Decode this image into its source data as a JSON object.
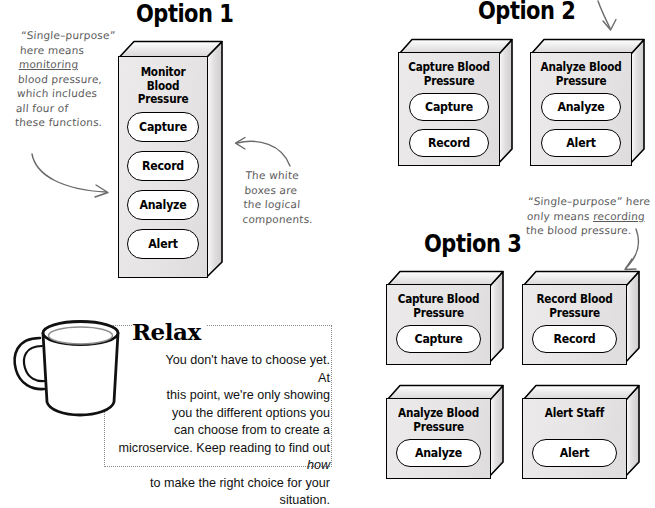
{
  "page": {
    "background": "#ffffff",
    "ink": "#000000",
    "note_ink": "#5b5b5b",
    "box_face": "#e8e6e6",
    "pill_face": "#ffffff"
  },
  "options": [
    {
      "id": "option-1",
      "heading": "Option 1",
      "boxes": [
        {
          "id": "monitor-blood-pressure",
          "title_line1": "Monitor Blood",
          "title_line2": "Pressure",
          "components": [
            "Capture",
            "Record",
            "Analyze",
            "Alert"
          ]
        }
      ]
    },
    {
      "id": "option-2",
      "heading": "Option 2",
      "boxes": [
        {
          "id": "capture-blood-pressure",
          "title_line1": "Capture Blood",
          "title_line2": "Pressure",
          "components": [
            "Capture",
            "Record"
          ]
        },
        {
          "id": "analyze-blood-pressure",
          "title_line1": "Analyze Blood",
          "title_line2": "Pressure",
          "components": [
            "Analyze",
            "Alert"
          ]
        }
      ]
    },
    {
      "id": "option-3",
      "heading": "Option 3",
      "boxes": [
        {
          "id": "capture-blood-pressure",
          "title_line1": "Capture Blood",
          "title_line2": "Pressure",
          "components": [
            "Capture"
          ]
        },
        {
          "id": "record-blood-pressure",
          "title_line1": "Record Blood",
          "title_line2": "Pressure",
          "components": [
            "Record"
          ]
        },
        {
          "id": "analyze-blood-pressure",
          "title_line1": "Analyze Blood",
          "title_line2": "Pressure",
          "components": [
            "Analyze"
          ]
        },
        {
          "id": "alert-staff",
          "title_line1": "Alert Staff",
          "title_line2": "",
          "components": [
            "Alert"
          ]
        }
      ]
    }
  ],
  "annotations": {
    "left_note": {
      "line1": "“Single–purpose”",
      "line2": "here means",
      "line3": "monitoring",
      "line4": "blood pressure,",
      "line5": "which includes",
      "line6": "all four of",
      "line7": "these functions."
    },
    "white_boxes_note": {
      "line1": "The white",
      "line2": "boxes are",
      "line3": "the logical",
      "line4": "components."
    },
    "recording_note": {
      "line1": "“Single–purpose” here",
      "line2": "only means recording",
      "line2_underlined": "recording",
      "line3": "the blood pressure."
    }
  },
  "relax": {
    "title": "Relax",
    "line1": "You don't have to choose yet. At",
    "line2": "this point, we're only showing",
    "line3": "you the different options you",
    "line4": "can choose from to create a",
    "line5": "microservice. Keep reading to find out how",
    "line5_italic": "how",
    "line6": "to make the right choice for your situation."
  }
}
